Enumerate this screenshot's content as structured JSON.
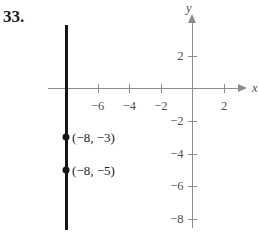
{
  "problem": {
    "number": "33."
  },
  "chart_data": {
    "type": "scatter",
    "title": "",
    "xlabel": "x",
    "ylabel": "y",
    "xlim": [
      -9.1,
      3.0
    ],
    "ylim": [
      -9.2,
      4.6
    ],
    "grid": false,
    "legend": false,
    "x_ticks": [
      {
        "value": -6,
        "label": "−6"
      },
      {
        "value": -4,
        "label": "−4"
      },
      {
        "value": -2,
        "label": "−2"
      },
      {
        "value": 2,
        "label": "2"
      }
    ],
    "y_ticks": [
      {
        "value": 2,
        "label": "2"
      },
      {
        "value": -2,
        "label": "−2"
      },
      {
        "value": -4,
        "label": "−4"
      },
      {
        "value": -6,
        "label": "−6"
      },
      {
        "value": -8,
        "label": "−8"
      }
    ],
    "points": [
      {
        "x": -8,
        "y": -3,
        "label": "(−8, −3)"
      },
      {
        "x": -8,
        "y": -5,
        "label": "(−8, −5)"
      }
    ],
    "lines": [
      {
        "name": "vertical-line-x-equals-negative-8",
        "equation": "x = -8",
        "x": -8,
        "y_from": 3.9,
        "y_to": -8.7
      }
    ],
    "colors": {
      "axis": "#8c8c8c",
      "tick_label": "#4f4f4f",
      "line": "#161616",
      "point": "#161616",
      "point_label": "#1b1b1b",
      "background": "#ffffff"
    }
  }
}
